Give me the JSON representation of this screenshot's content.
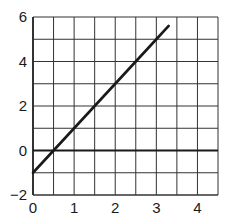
{
  "chart_data": {
    "type": "line",
    "title": "",
    "xlabel": "",
    "ylabel": "",
    "xlim": [
      0,
      4.5
    ],
    "ylim": [
      -2,
      6
    ],
    "grid": true,
    "grid_step": {
      "x": 0.5,
      "y": 1
    },
    "x_ticks": [
      0,
      1,
      2,
      3,
      4
    ],
    "y_ticks": [
      -2,
      0,
      2,
      4,
      6
    ],
    "x_tick_labels": [
      "0",
      "1",
      "2",
      "3",
      "4"
    ],
    "y_tick_labels": [
      "−2",
      "0",
      "2",
      "4",
      "6"
    ],
    "series": [
      {
        "name": "line",
        "equation": "y = 2x - 1",
        "x": [
          0,
          0.5,
          1,
          2,
          3,
          3.3
        ],
        "y": [
          -1,
          0,
          1,
          3,
          5,
          5.6
        ],
        "color": "#1a1a1a"
      }
    ],
    "reference_lines": [
      {
        "axis": "y",
        "value": 0,
        "color": "#1a1a1a"
      }
    ],
    "legend": null
  }
}
